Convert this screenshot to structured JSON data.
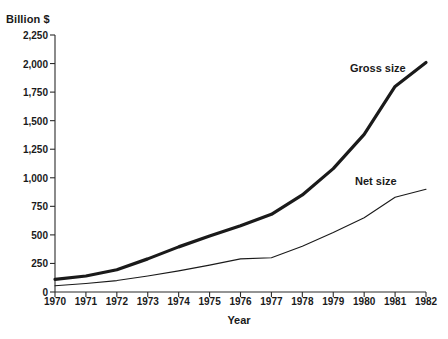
{
  "chart_data": {
    "type": "line",
    "title": "",
    "xlabel": "Year",
    "ylabel": "Billion $",
    "x": [
      1970,
      1971,
      1972,
      1973,
      1974,
      1975,
      1976,
      1977,
      1978,
      1979,
      1980,
      1981,
      1982
    ],
    "xtick_labels": [
      "1970",
      "1971",
      "1972",
      "1973",
      "1974",
      "1975",
      "1976",
      "1977",
      "1978",
      "1979",
      "1980",
      "1981",
      "1982"
    ],
    "ytick_labels": [
      "0",
      "250",
      "500",
      "750",
      "1,000",
      "1,250",
      "1,500",
      "1,750",
      "2,000",
      "2,250"
    ],
    "ytick_values": [
      0,
      250,
      500,
      750,
      1000,
      1250,
      1500,
      1750,
      2000,
      2250
    ],
    "ylim": [
      0,
      2250
    ],
    "xlim": [
      1970,
      1982
    ],
    "grid": false,
    "legend_position": "inline-annotation",
    "series": [
      {
        "name": "Gross size",
        "style": "thick",
        "color": "#1a1a1a",
        "width": 3.2,
        "values": [
          110,
          140,
          195,
          290,
          395,
          490,
          580,
          680,
          850,
          1080,
          1380,
          1800,
          2010
        ]
      },
      {
        "name": "Net size",
        "style": "thin",
        "color": "#1a1a1a",
        "width": 1.1,
        "values": [
          55,
          75,
          100,
          140,
          185,
          235,
          290,
          300,
          400,
          520,
          650,
          830,
          900
        ]
      }
    ],
    "annotations": [
      {
        "text": "Gross size",
        "x_px": 350,
        "y_px": 62
      },
      {
        "text": "Net size",
        "x_px": 355,
        "y_px": 175
      }
    ]
  },
  "axes": {
    "y_title": "Billion $",
    "x_title": "Year"
  }
}
